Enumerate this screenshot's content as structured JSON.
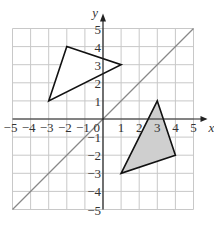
{
  "diagram": {
    "type": "coordinate-grid",
    "x_axis": {
      "label": "x",
      "min": -5,
      "max": 5,
      "ticks": [
        "-5",
        "-4",
        "-3",
        "-2",
        "-1",
        "1",
        "2",
        "3",
        "4",
        "5"
      ]
    },
    "y_axis": {
      "label": "y",
      "min": -5,
      "max": 5,
      "ticks": [
        "5",
        "4",
        "3",
        "2",
        "1",
        "-1",
        "-2",
        "-3",
        "-4",
        "-5"
      ]
    },
    "origin_label": "0",
    "line": {
      "equation": "y = x",
      "from": [
        -5,
        -5
      ],
      "to": [
        5,
        5
      ],
      "color": "#888888"
    },
    "shapes": [
      {
        "name": "triangle-a",
        "vertices": [
          [
            -3,
            1
          ],
          [
            -2,
            4
          ],
          [
            1,
            3
          ]
        ],
        "fill": "#ffffff",
        "stroke": "#111111"
      },
      {
        "name": "triangle-b",
        "vertices": [
          [
            3,
            1
          ],
          [
            4,
            -2
          ],
          [
            1,
            -3
          ]
        ],
        "fill": "#cfcfcf",
        "stroke": "#111111"
      }
    ],
    "colors": {
      "grid": "#c8c8c8",
      "axis": "#222222",
      "text": "#333333"
    }
  }
}
